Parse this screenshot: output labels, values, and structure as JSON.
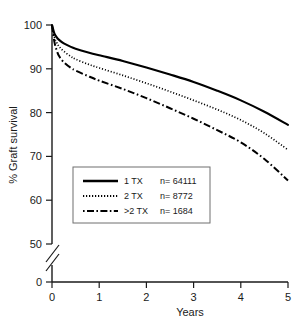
{
  "chart_data": {
    "type": "line",
    "title": "",
    "xlabel": "Years",
    "ylabel": "% Graft survival",
    "xlim": [
      0,
      5
    ],
    "ylim": [
      50,
      100
    ],
    "grid": false,
    "axis_break": true,
    "axis_break_note": "y-axis broken between 50 and 0",
    "xticks": [
      "0",
      "1",
      "2",
      "3",
      "4",
      "5"
    ],
    "xtick_values": [
      0,
      1,
      2,
      3,
      4,
      5
    ],
    "yticks": [
      "100",
      "90",
      "80",
      "70",
      "60",
      "50",
      "0"
    ],
    "ytick_values": [
      100,
      90,
      80,
      70,
      60,
      50,
      0
    ],
    "legend_position": "lower-left inside plot",
    "x": [
      0,
      0.05,
      0.1,
      0.15,
      0.25,
      0.4,
      0.5,
      0.75,
      1,
      1.5,
      2,
      2.5,
      3,
      3.5,
      4,
      4.5,
      5
    ],
    "series": [
      {
        "name": "1 TX",
        "n_label": "n= 64111",
        "n": 64111,
        "style": "solid",
        "values": [
          100,
          98.1,
          97.2,
          96.6,
          95.8,
          95.0,
          94.6,
          93.8,
          93.1,
          91.8,
          90.3,
          88.7,
          87.0,
          85.0,
          82.8,
          80.2,
          77.2
        ]
      },
      {
        "name": "2 TX",
        "n_label": "n= 8772",
        "n": 8772,
        "style": "dotted",
        "values": [
          100,
          97.3,
          96.0,
          95.1,
          94.0,
          92.8,
          92.2,
          91.1,
          90.2,
          88.5,
          86.7,
          84.8,
          82.8,
          80.7,
          78.3,
          75.3,
          71.5
        ]
      },
      {
        "name": ">2 TX",
        "n_label": "n= 1684",
        "n": 1684,
        "style": "dashdot",
        "values": [
          100,
          96.2,
          94.2,
          92.9,
          91.5,
          90.2,
          89.6,
          88.4,
          87.3,
          85.4,
          83.3,
          81.0,
          78.6,
          76.0,
          73.2,
          69.4,
          64.5
        ]
      }
    ]
  },
  "axes": {
    "x_title": "Years",
    "y_title": "% Graft survival"
  },
  "legend": {
    "entries": [
      {
        "label": "1 TX",
        "count": "n= 64111"
      },
      {
        "label": "2 TX",
        "count": "n= 8772"
      },
      {
        "label": ">2 TX",
        "count": "n= 1684"
      }
    ]
  },
  "colors": {
    "line": "#000000",
    "axis": "#1a1a1a",
    "background": "#ffffff",
    "legend_border": "#6f6f6f"
  }
}
